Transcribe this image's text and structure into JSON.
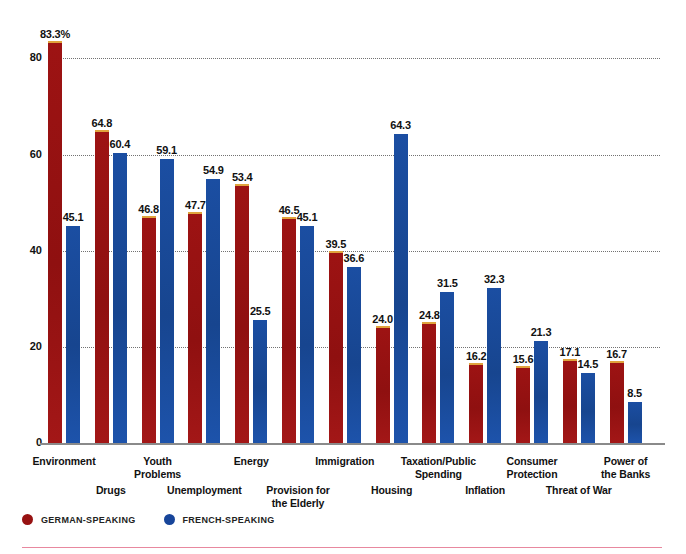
{
  "chart_data": {
    "type": "bar",
    "title": "",
    "subtitle": "",
    "xlabel": "",
    "ylabel": "",
    "ylim": [
      0,
      88
    ],
    "yticks": [
      0,
      20,
      40,
      60,
      80
    ],
    "ytick_labels": [
      "0",
      "20",
      "40",
      "60",
      "80"
    ],
    "grid": true,
    "grid_style": "dotted-horizontal",
    "legend_position": "bottom-left",
    "value_label_suffix_first": "%",
    "categories": [
      "Environment",
      "Drugs",
      "Youth Problems",
      "Unemployment",
      "Energy",
      "Provision for the Elderly",
      "Immigration",
      "Housing",
      "Taxation/Public Spending",
      "Inflation",
      "Consumer Protection",
      "Threat of War",
      "Power of the Banks"
    ],
    "category_lines": [
      [
        "Environment"
      ],
      [
        "Drugs"
      ],
      [
        "Youth",
        "Problems"
      ],
      [
        "Unemployment"
      ],
      [
        "Energy"
      ],
      [
        "Provision for",
        "the Elderly"
      ],
      [
        "Immigration"
      ],
      [
        "Housing"
      ],
      [
        "Taxation/Public",
        "Spending"
      ],
      [
        "Inflation"
      ],
      [
        "Consumer",
        "Protection"
      ],
      [
        "Threat of War"
      ],
      [
        "Power of",
        "the Banks"
      ]
    ],
    "series": [
      {
        "name": "GERMAN-SPEAKING",
        "color": "#9d1313",
        "values": [
          83.3,
          64.8,
          46.8,
          47.7,
          53.4,
          46.5,
          39.5,
          24.0,
          24.8,
          16.2,
          15.6,
          17.1,
          16.7
        ],
        "labels": [
          "83.3%",
          "64.8",
          "46.8",
          "47.7",
          "53.4",
          "46.5",
          "39.5",
          "24.0",
          "24.8",
          "16.2",
          "15.6",
          "17.1",
          "16.7"
        ]
      },
      {
        "name": "FRENCH-SPEAKING",
        "color": "#1b4ea2",
        "values": [
          45.1,
          60.4,
          59.1,
          54.9,
          25.5,
          45.1,
          36.6,
          64.3,
          31.5,
          32.3,
          21.3,
          14.5,
          8.5
        ],
        "labels": [
          "45.1",
          "60.4",
          "59.1",
          "54.9",
          "25.5",
          "45.1",
          "36.6",
          "64.3",
          "31.5",
          "32.3",
          "21.3",
          "14.5",
          "8.5"
        ]
      }
    ]
  },
  "legend": {
    "items": [
      {
        "label": "GERMAN-SPEAKING",
        "color": "#971212"
      },
      {
        "label": "FRENCH-SPEAKING",
        "color": "#17459a"
      }
    ]
  }
}
